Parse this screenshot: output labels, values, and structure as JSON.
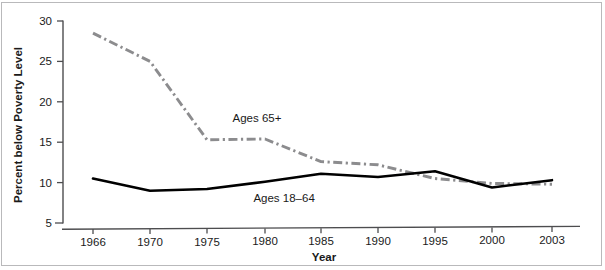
{
  "chart_data": {
    "type": "line",
    "title": "",
    "subtitle": "",
    "xlabel": "Year",
    "ylabel": "Percent below Poverty Level",
    "x": [
      1966,
      1970,
      1975,
      1980,
      1985,
      1990,
      1995,
      2000,
      2003
    ],
    "xticklabels": [
      "1966",
      "1970",
      "1975",
      "1980",
      "1985",
      "1990",
      "1995",
      "2000",
      "2003"
    ],
    "yticklabels": [
      "5",
      "10",
      "15",
      "20",
      "25",
      "30"
    ],
    "yticks": [
      5,
      10,
      15,
      20,
      25,
      30
    ],
    "ylim": [
      5,
      30
    ],
    "xlim": [
      1964.5,
      2004.5
    ],
    "grid": false,
    "legend_position": "inline-annotations",
    "series": [
      {
        "name": "Ages 65+",
        "style": "dash-dot",
        "color": "#8c8c8e",
        "values": [
          28.5,
          25.0,
          15.3,
          15.4,
          12.6,
          12.2,
          10.5,
          9.9,
          9.8
        ]
      },
      {
        "name": "Ages 18–64",
        "style": "solid",
        "color": "#000000",
        "values": [
          10.5,
          9.0,
          9.2,
          10.1,
          11.1,
          10.7,
          11.4,
          9.4,
          10.3
        ]
      }
    ],
    "annotations": [
      {
        "text": "Ages 65+",
        "x": 1977.2,
        "y": 17.5
      },
      {
        "text": "Ages 18–64",
        "x": 1979.0,
        "y": 7.55
      }
    ]
  },
  "axes": {
    "y_axis_title": "Percent below Poverty Level",
    "x_axis_title": "Year"
  },
  "labels": {
    "y_30": "30",
    "y_25": "25",
    "y_20": "20",
    "y_15": "15",
    "y_10": "10",
    "y_5": "5",
    "x_1966": "1966",
    "x_1970": "1970",
    "x_1975": "1975",
    "x_1980": "1980",
    "x_1985": "1985",
    "x_1990": "1990",
    "x_1995": "1995",
    "x_2000": "2000",
    "x_2003": "2003",
    "series_65plus": "Ages 65+",
    "series_18to64": "Ages 18–64"
  },
  "colors": {
    "series_65plus": "#8c8c8e",
    "series_18to64": "#000000",
    "axis": "#4d4d4f",
    "text": "#1a1a1a",
    "background": "#ffffff"
  }
}
